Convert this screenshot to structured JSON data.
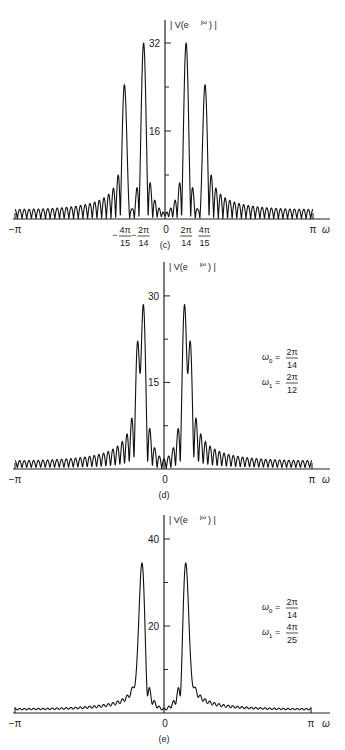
{
  "chart_data": [
    {
      "id": "c",
      "type": "line",
      "caption": "(c)",
      "ylabel": "| V(e^{jω}) |",
      "xlabel": "ω",
      "x_range": [
        "-π",
        "π"
      ],
      "yticks": [
        {
          "value": 16,
          "label": "16"
        },
        {
          "value": 32,
          "label": "32"
        }
      ],
      "minor_yticks": [
        8,
        24
      ],
      "ylim": [
        0,
        36
      ],
      "xtick_labels": [
        {
          "label": "−π",
          "pos": -1.0
        },
        {
          "label": "−2π/14",
          "pos": -0.142857,
          "num": "2π",
          "den": "14",
          "neg": true
        },
        {
          "label": "−4π/15",
          "pos": -0.266667,
          "num": "4π",
          "den": "15",
          "neg": true
        },
        {
          "label": "0",
          "pos": 0
        },
        {
          "label": "2π/14",
          "pos": 0.142857,
          "num": "2π",
          "den": "14"
        },
        {
          "label": "4π/15",
          "pos": 0.266667,
          "num": "4π",
          "den": "15"
        },
        {
          "label": "π",
          "pos": 1.0
        }
      ],
      "signal": {
        "N": 64,
        "window": "rectangular",
        "components": [
          {
            "freq_over_pi": 0.142857,
            "amp": 1.0
          },
          {
            "freq_over_pi": 0.266667,
            "amp": 0.75
          }
        ]
      },
      "peaks": [
        {
          "omega": "-4π/15",
          "magnitude": 24
        },
        {
          "omega": "-2π/14",
          "magnitude": 32
        },
        {
          "omega": "2π/14",
          "magnitude": 32
        },
        {
          "omega": "4π/15",
          "magnitude": 24
        }
      ],
      "annotation": []
    },
    {
      "id": "d",
      "type": "line",
      "caption": "(d)",
      "ylabel": "| V(e^{jω}) |",
      "xlabel": "ω",
      "x_range": [
        "-π",
        "π"
      ],
      "yticks": [
        {
          "value": 15,
          "label": "15"
        },
        {
          "value": 30,
          "label": "30"
        }
      ],
      "minor_yticks": [
        7.5,
        22.5
      ],
      "ylim": [
        0,
        34
      ],
      "xtick_labels": [
        {
          "label": "−π",
          "pos": -1.0
        },
        {
          "label": "0",
          "pos": 0
        },
        {
          "label": "π",
          "pos": 1.0
        }
      ],
      "signal": {
        "N": 64,
        "window": "rectangular",
        "components": [
          {
            "freq_over_pi": 0.142857,
            "amp": 1.0
          },
          {
            "freq_over_pi": 0.166667,
            "amp": 0.75
          }
        ]
      },
      "peaks": [
        {
          "omega": "-2π/12",
          "magnitude": 22.5
        },
        {
          "omega": "-2π/14",
          "magnitude": 28.5
        },
        {
          "omega": "2π/14",
          "magnitude": 28.5
        },
        {
          "omega": "2π/12",
          "magnitude": 22.5
        }
      ],
      "annotation": [
        {
          "sym": "ω",
          "sub": "0",
          "num": "2π",
          "den": "14"
        },
        {
          "sym": "ω",
          "sub": "1",
          "num": "2π",
          "den": "12"
        }
      ]
    },
    {
      "id": "e",
      "type": "line",
      "caption": "(e)",
      "ylabel": "| V(e^{jω}) |",
      "xlabel": "ω",
      "x_range": [
        "-π",
        "π"
      ],
      "yticks": [
        {
          "value": 20,
          "label": "20"
        },
        {
          "value": 40,
          "label": "40"
        }
      ],
      "minor_yticks": [
        10,
        30
      ],
      "ylim": [
        0,
        45
      ],
      "xtick_labels": [
        {
          "label": "−π",
          "pos": -1.0
        },
        {
          "label": "0",
          "pos": 0
        },
        {
          "label": "π",
          "pos": 1.0
        }
      ],
      "signal": {
        "N": 64,
        "window": "rectangular",
        "components": [
          {
            "freq_over_pi": 0.142857,
            "amp": 1.0
          },
          {
            "freq_over_pi": 0.16,
            "amp": 0.75
          }
        ]
      },
      "peaks": [
        {
          "omega": "-2π/14",
          "magnitude": 34.5
        },
        {
          "omega": "2π/14",
          "magnitude": 34.5
        }
      ],
      "annotation": [
        {
          "sym": "ω",
          "sub": "0",
          "num": "2π",
          "den": "14"
        },
        {
          "sym": "ω",
          "sub": "1",
          "num": "4π",
          "den": "25"
        }
      ]
    }
  ],
  "layout": {
    "panels": [
      {
        "top": 0,
        "height": 250,
        "axis_y": 219,
        "zero_x": 165,
        "left_x": 15,
        "right_x": 313,
        "top_y": 20,
        "scale_px_per_unit": 5.5,
        "ann_x": 262,
        "ann_y": 0
      },
      {
        "top": 250,
        "height": 250,
        "axis_y": 219,
        "zero_x": 164,
        "left_x": 15,
        "right_x": 312,
        "top_y": 12,
        "scale_px_per_unit": 5.77,
        "ann_x": 262,
        "ann_y": 105
      },
      {
        "top": 500,
        "height": 250,
        "axis_y": 213,
        "zero_x": 164,
        "left_x": 15,
        "right_x": 311,
        "top_y": 15,
        "scale_px_per_unit": 4.35,
        "ann_x": 262,
        "ann_y": 105
      }
    ]
  }
}
